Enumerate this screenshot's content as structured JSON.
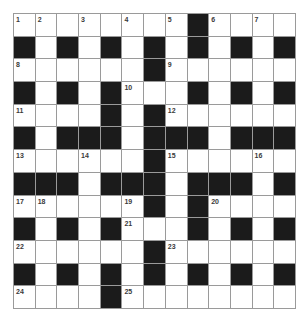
{
  "puzzle": {
    "rows": 13,
    "cols": 13,
    "colors": {
      "block": "#1b1b1b",
      "cell": "#ffffff",
      "gridline": "#9a9a9a",
      "number": "#3a3a3a"
    },
    "grid": [
      "........#....",
      "#.#.#.#.#.#.#",
      "......#......",
      "#.#.#...#.#.#",
      "....#.#......",
      "#.###.###.###",
      "......#......",
      "###.###.###.#",
      "......#.#....",
      "#.#.#...#.#.#",
      "......#......",
      "#.#.#.#.#.#.#",
      "....#........"
    ],
    "numbers": [
      {
        "r": 0,
        "c": 0,
        "n": "1"
      },
      {
        "r": 0,
        "c": 1,
        "n": "2"
      },
      {
        "r": 0,
        "c": 3,
        "n": "3"
      },
      {
        "r": 0,
        "c": 5,
        "n": "4"
      },
      {
        "r": 0,
        "c": 7,
        "n": "5"
      },
      {
        "r": 0,
        "c": 9,
        "n": "6"
      },
      {
        "r": 0,
        "c": 11,
        "n": "7"
      },
      {
        "r": 2,
        "c": 0,
        "n": "8"
      },
      {
        "r": 2,
        "c": 7,
        "n": "9"
      },
      {
        "r": 3,
        "c": 5,
        "n": "10"
      },
      {
        "r": 4,
        "c": 0,
        "n": "11"
      },
      {
        "r": 4,
        "c": 7,
        "n": "12"
      },
      {
        "r": 6,
        "c": 0,
        "n": "13"
      },
      {
        "r": 6,
        "c": 3,
        "n": "14"
      },
      {
        "r": 6,
        "c": 7,
        "n": "15"
      },
      {
        "r": 6,
        "c": 11,
        "n": "16"
      },
      {
        "r": 8,
        "c": 0,
        "n": "17"
      },
      {
        "r": 8,
        "c": 1,
        "n": "18"
      },
      {
        "r": 8,
        "c": 5,
        "n": "19"
      },
      {
        "r": 8,
        "c": 9,
        "n": "20"
      },
      {
        "r": 9,
        "c": 5,
        "n": "21"
      },
      {
        "r": 10,
        "c": 0,
        "n": "22"
      },
      {
        "r": 10,
        "c": 7,
        "n": "23"
      },
      {
        "r": 12,
        "c": 0,
        "n": "24"
      },
      {
        "r": 12,
        "c": 5,
        "n": "25"
      }
    ]
  }
}
